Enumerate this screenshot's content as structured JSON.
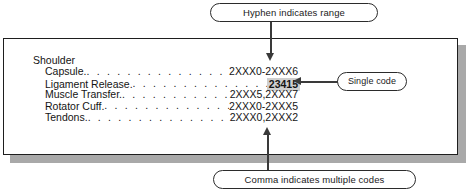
{
  "figure": {
    "type": "annotated-code-listing",
    "group_title": "Shoulder",
    "rows": [
      {
        "label": "Capsule.",
        "leader": ". . . . . . . . . . . . . . . . . . . . . .",
        "code": "2XXX0-2XXX6",
        "highlighted": false
      },
      {
        "label": "Ligament Release.",
        "leader": ". . . . . . . . . . . . . . . . . . .",
        "code": "23415",
        "highlighted": true
      },
      {
        "label": "Muscle Transfer.",
        "leader": ". . . . . . . . . . . . . . . . . . .",
        "code": "2XXX5,2XXX7",
        "highlighted": false
      },
      {
        "label": "Rotator Cuff.",
        "leader": ". . . . . . . . . . . . . . . . . . . . .",
        "code": "2XXX0-2XXX5",
        "highlighted": false
      },
      {
        "label": "Tendons.",
        "leader": ". . . . . . . . . . . . . . . . . . . . . .",
        "code": "2XXX0,2XXX2",
        "highlighted": false
      }
    ],
    "callouts": {
      "hyphen": "Hyphen indicates range",
      "single": "Single code",
      "comma": "Comma indicates multiple codes"
    },
    "colors": {
      "background": "#ffffff",
      "text": "#141414",
      "outline": "#1e1e1e",
      "arrow": "#3a3a3a",
      "highlight": "#cfcfcf",
      "shadow": "#a9a9a9"
    }
  }
}
